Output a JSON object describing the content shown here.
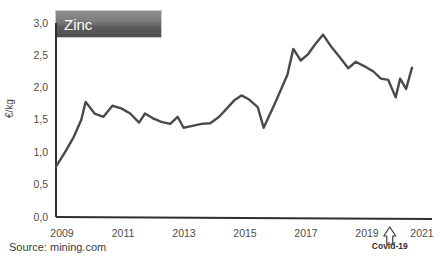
{
  "chart_data": {
    "type": "line",
    "title": "Zinc",
    "xlabel": "",
    "ylabel": "€/kg",
    "xlim": [
      2009,
      2021
    ],
    "ylim": [
      0.0,
      3.0
    ],
    "y_ticks": [
      "0,0",
      "0,5",
      "1,0",
      "1,5",
      "2,0",
      "2,5",
      "3,0"
    ],
    "y_tick_values": [
      0.0,
      0.5,
      1.0,
      1.5,
      2.0,
      2.5,
      3.0
    ],
    "x_ticks": [
      "2009",
      "2011",
      "2013",
      "2015",
      "2017",
      "2019",
      "2021"
    ],
    "x_tick_values": [
      2009,
      2011,
      2013,
      2015,
      2017,
      2019,
      2021
    ],
    "grid": false,
    "legend": false,
    "line_color": "#4a4a4a",
    "series": [
      {
        "name": "Zinc price",
        "unit": "€/kg",
        "x": [
          2009.0,
          2009.3,
          2009.6,
          2009.85,
          2010.0,
          2010.3,
          2010.6,
          2010.9,
          2011.2,
          2011.5,
          2011.8,
          2012.0,
          2012.25,
          2012.55,
          2012.85,
          2013.1,
          2013.3,
          2013.6,
          2013.9,
          2014.2,
          2014.5,
          2014.8,
          2015.0,
          2015.25,
          2015.5,
          2015.8,
          2016.0,
          2016.4,
          2016.8,
          2017.0,
          2017.25,
          2017.5,
          2017.75,
          2018.0,
          2018.3,
          2018.6,
          2018.85,
          2019.1,
          2019.4,
          2019.7,
          2019.95,
          2020.2,
          2020.45,
          2020.6,
          2020.8,
          2021.0
        ],
        "values": [
          0.78,
          1.0,
          1.24,
          1.5,
          1.78,
          1.6,
          1.55,
          1.72,
          1.68,
          1.6,
          1.46,
          1.6,
          1.53,
          1.47,
          1.44,
          1.55,
          1.38,
          1.41,
          1.44,
          1.45,
          1.55,
          1.7,
          1.8,
          1.88,
          1.82,
          1.7,
          1.38,
          1.78,
          2.2,
          2.6,
          2.42,
          2.52,
          2.68,
          2.82,
          2.62,
          2.45,
          2.3,
          2.4,
          2.33,
          2.25,
          2.14,
          2.12,
          1.85,
          2.14,
          1.98,
          2.31
        ]
      }
    ],
    "annotations": [
      {
        "name": "covid-19",
        "label": "Covid-19",
        "marker": "up-arrow",
        "x": 2020.25
      }
    ],
    "source": "Source: mining.com"
  }
}
